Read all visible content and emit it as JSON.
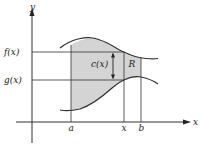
{
  "diagram": {
    "axes": {
      "x_label": "x",
      "y_label": "y"
    },
    "y_ticks": {
      "f": "f(x)",
      "g": "g(x)"
    },
    "x_ticks": {
      "a": "a",
      "x": "x",
      "b": "b"
    },
    "annotations": {
      "cross_section": "c(x)",
      "region": "R"
    },
    "colors": {
      "shade": "#d4d4d4",
      "line": "#333333",
      "background": "#ffffff"
    }
  }
}
